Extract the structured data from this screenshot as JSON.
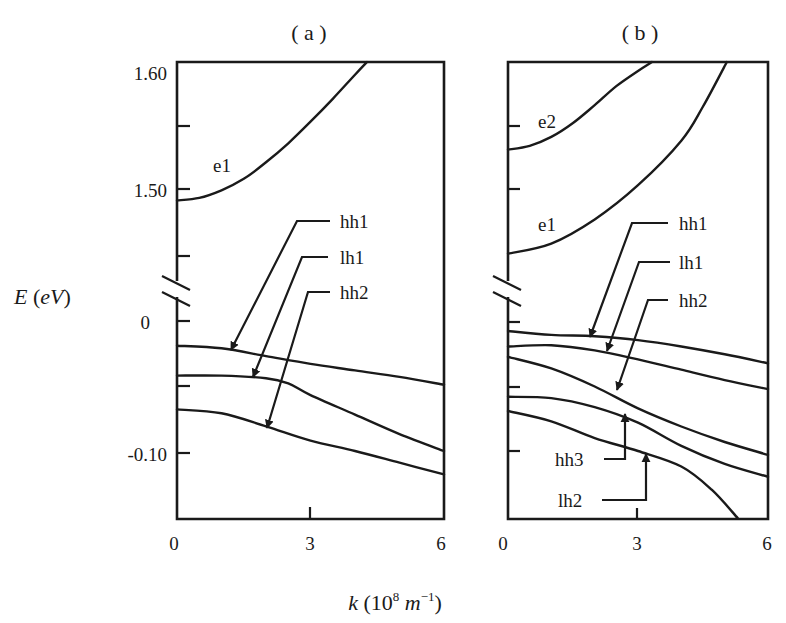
{
  "figure": {
    "y_axis_label": "E (eV)",
    "x_axis_label_main": "k (10",
    "x_axis_label_exp": "8",
    "x_axis_label_unit": " m",
    "x_axis_label_unit_exp": "−1",
    "x_axis_label_close": ")"
  },
  "chart_data": [
    {
      "type": "line",
      "title": "( a )",
      "xlabel": "k (10^8 m^-1)",
      "ylabel": "E (eV)",
      "xlim": [
        0,
        6
      ],
      "x_ticks": [
        "0",
        "3",
        "6"
      ],
      "ylim_upper_segment": [
        1.425,
        1.6
      ],
      "ylim_lower_segment": [
        -0.152,
        0.035
      ],
      "y_axis_break": true,
      "y_tick_labels": [
        "1.60",
        "1.50",
        "0",
        "-0.10"
      ],
      "y_tick_values": [
        1.6,
        1.55,
        1.5,
        1.45,
        0,
        -0.05,
        -0.1
      ],
      "grid": false,
      "series": [
        {
          "name": "e1",
          "x": [
            0,
            0.5,
            1,
            1.5,
            2,
            2.5,
            3,
            3.5,
            4,
            4.27
          ],
          "y": [
            1.491,
            1.493,
            1.499,
            1.508,
            1.521,
            1.536,
            1.553,
            1.571,
            1.59,
            1.6
          ]
        },
        {
          "name": "hh1",
          "x": [
            0,
            1,
            2,
            3,
            4,
            5,
            6
          ],
          "y": [
            -0.019,
            -0.021,
            -0.027,
            -0.033,
            -0.038,
            -0.043,
            -0.049
          ]
        },
        {
          "name": "lh1",
          "x": [
            0,
            1,
            2,
            2.5,
            3,
            4,
            5,
            6
          ],
          "y": [
            -0.042,
            -0.042,
            -0.044,
            -0.048,
            -0.057,
            -0.072,
            -0.087,
            -0.1
          ]
        },
        {
          "name": "hh2",
          "x": [
            0,
            1,
            2,
            3,
            4,
            5,
            6
          ],
          "y": [
            -0.068,
            -0.071,
            -0.081,
            -0.092,
            -0.1,
            -0.109,
            -0.118
          ]
        }
      ],
      "annotations": [
        "e1",
        "hh1",
        "lh1",
        "hh2"
      ]
    },
    {
      "type": "line",
      "title": "( b )",
      "xlabel": "k (10^8 m^-1)",
      "ylabel": "E (eV)",
      "xlim": [
        0,
        6
      ],
      "x_ticks": [
        "0",
        "3",
        "6"
      ],
      "ylim_upper_segment": [
        1.425,
        1.6
      ],
      "ylim_lower_segment": [
        -0.152,
        0.035
      ],
      "y_axis_break": true,
      "y_tick_values": [
        1.55,
        1.5,
        0,
        -0.05,
        -0.1
      ],
      "grid": false,
      "series": [
        {
          "name": "e2",
          "x": [
            0,
            0.5,
            1,
            1.5,
            2,
            2.5,
            3,
            3.32
          ],
          "y": [
            1.531,
            1.534,
            1.541,
            1.552,
            1.566,
            1.581,
            1.593,
            1.6
          ]
        },
        {
          "name": "e1",
          "x": [
            0,
            1,
            2,
            3,
            4,
            4.5,
            5.05
          ],
          "y": [
            1.449,
            1.457,
            1.476,
            1.503,
            1.538,
            1.565,
            1.6
          ]
        },
        {
          "name": "hh1",
          "x": [
            0,
            1,
            2,
            3,
            4,
            5,
            6
          ],
          "y": [
            -0.007,
            -0.01,
            -0.011,
            -0.014,
            -0.019,
            -0.025,
            -0.032
          ]
        },
        {
          "name": "lh1",
          "x": [
            0,
            1,
            2,
            3,
            4,
            5,
            6
          ],
          "y": [
            -0.019,
            -0.018,
            -0.022,
            -0.029,
            -0.037,
            -0.045,
            -0.052
          ]
        },
        {
          "name": "hh2",
          "x": [
            0,
            1,
            2,
            3,
            4,
            5,
            6
          ],
          "y": [
            -0.027,
            -0.036,
            -0.05,
            -0.067,
            -0.081,
            -0.093,
            -0.103
          ]
        },
        {
          "name": "hh3",
          "x": [
            0,
            1,
            2,
            3,
            4,
            5,
            6
          ],
          "y": [
            -0.058,
            -0.059,
            -0.066,
            -0.078,
            -0.096,
            -0.11,
            -0.12
          ]
        },
        {
          "name": "lh2",
          "x": [
            0,
            1,
            2,
            3,
            4,
            4.7,
            5.3
          ],
          "y": [
            -0.069,
            -0.077,
            -0.09,
            -0.1,
            -0.112,
            -0.13,
            -0.152
          ]
        }
      ],
      "annotations": [
        "e2",
        "e1",
        "hh1",
        "lh1",
        "hh2",
        "hh3",
        "lh2"
      ]
    }
  ]
}
